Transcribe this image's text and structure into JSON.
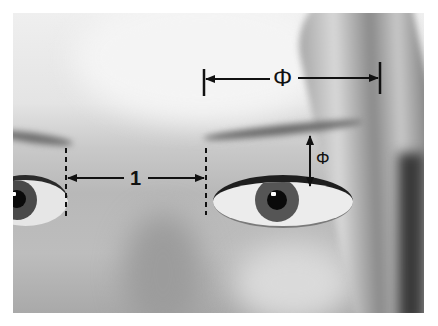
{
  "figure": {
    "annotations": {
      "inter_eye_distance": {
        "label": "1"
      },
      "eye_to_brow_outer_width": {
        "label": "Φ"
      },
      "eye_to_brow_height": {
        "label": "Φ"
      }
    },
    "colors": {
      "annotation": "#111111",
      "background": "#ffffff"
    }
  }
}
